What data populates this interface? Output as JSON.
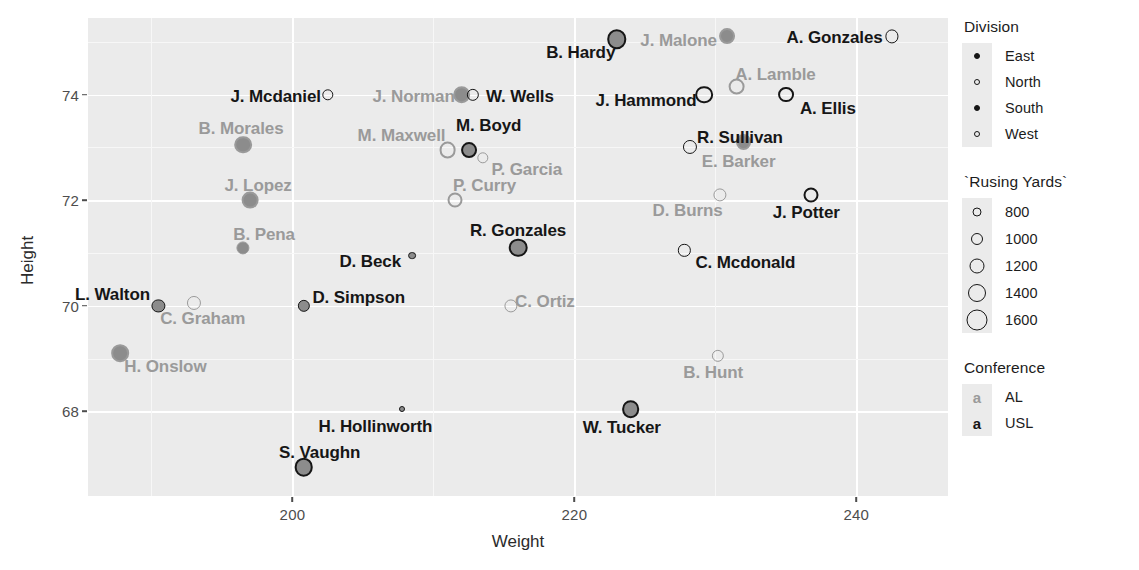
{
  "chart_data": {
    "type": "scatter",
    "title": "",
    "xlabel": "Weight",
    "ylabel": "Height",
    "xlim": [
      185.5,
      246.5
    ],
    "ylim": [
      66.4,
      75.45
    ],
    "xticks": [
      200,
      220,
      240
    ],
    "yticks": [
      68,
      70,
      72,
      74
    ],
    "grid": true,
    "legend_position": "right",
    "size_field": "`Rusing Yards`",
    "color_field": "Conference",
    "shape_field": "Division",
    "points": [
      {
        "label": "B. Hardy",
        "x": 223.0,
        "y": 75.05,
        "yards": 1350,
        "conference": "USL",
        "division": "South",
        "label_dx": -36,
        "label_dy": 14
      },
      {
        "label": "J. Malone",
        "x": 230.8,
        "y": 75.1,
        "yards": 1150,
        "conference": "AL",
        "division": "South",
        "label_dx": -48,
        "label_dy": 5
      },
      {
        "label": "A. Gonzales",
        "x": 242.5,
        "y": 75.1,
        "yards": 1000,
        "conference": "USL",
        "division": "West",
        "label_dx": -57,
        "label_dy": 2
      },
      {
        "label": "J. Mcdaniel",
        "x": 202.5,
        "y": 74.0,
        "yards": 900,
        "conference": "USL",
        "division": "North",
        "label_dx": -52,
        "label_dy": 2
      },
      {
        "label": "J. Norman",
        "x": 212.0,
        "y": 74.0,
        "yards": 1250,
        "conference": "AL",
        "division": "South",
        "label_dx": -48,
        "label_dy": 2
      },
      {
        "label": "W. Wells",
        "x": 212.8,
        "y": 74.0,
        "yards": 950,
        "conference": "USL",
        "division": "West",
        "label_dx": 47,
        "label_dy": 2
      },
      {
        "label": "J. Hammond",
        "x": 229.2,
        "y": 74.0,
        "yards": 1250,
        "conference": "USL",
        "division": "West",
        "label_dx": -58,
        "label_dy": 6
      },
      {
        "label": "A. Lamble",
        "x": 231.5,
        "y": 74.15,
        "yards": 1200,
        "conference": "AL",
        "division": "West",
        "label_dx": 39,
        "label_dy": -12
      },
      {
        "label": "A. Ellis",
        "x": 235.0,
        "y": 74.0,
        "yards": 1150,
        "conference": "USL",
        "division": "West",
        "label_dx": 42,
        "label_dy": 14
      },
      {
        "label": "B. Morales",
        "x": 196.5,
        "y": 73.05,
        "yards": 1250,
        "conference": "AL",
        "division": "South",
        "label_dx": -2,
        "label_dy": -16
      },
      {
        "label": "M. Maxwell",
        "x": 211.0,
        "y": 72.95,
        "yards": 1200,
        "conference": "AL",
        "division": "West",
        "label_dx": -46,
        "label_dy": -14
      },
      {
        "label": "M. Boyd",
        "x": 212.5,
        "y": 72.95,
        "yards": 1150,
        "conference": "USL",
        "division": "South",
        "label_dx": 20,
        "label_dy": -24
      },
      {
        "label": "P. Garcia",
        "x": 213.5,
        "y": 72.8,
        "yards": 900,
        "conference": "AL",
        "division": "West",
        "label_dx": 44,
        "label_dy": 12
      },
      {
        "label": "R. Sullivan",
        "x": 228.2,
        "y": 73.0,
        "yards": 1050,
        "conference": "USL",
        "division": "West",
        "label_dx": 50,
        "label_dy": -9
      },
      {
        "label": "E. Barker",
        "x": 232.0,
        "y": 73.1,
        "yards": 1150,
        "conference": "AL",
        "division": "South",
        "label_dx": -5,
        "label_dy": 20
      },
      {
        "label": "J. Lopez",
        "x": 197.0,
        "y": 72.0,
        "yards": 1200,
        "conference": "AL",
        "division": "South",
        "label_dx": 8,
        "label_dy": -14
      },
      {
        "label": "P. Curry",
        "x": 211.5,
        "y": 72.0,
        "yards": 1100,
        "conference": "AL",
        "division": "West",
        "label_dx": 30,
        "label_dy": -14
      },
      {
        "label": "D. Burns",
        "x": 230.3,
        "y": 72.1,
        "yards": 1000,
        "conference": "AL",
        "division": "West",
        "label_dx": -32,
        "label_dy": 16
      },
      {
        "label": "J. Potter",
        "x": 236.8,
        "y": 72.1,
        "yards": 1100,
        "conference": "USL",
        "division": "West",
        "label_dx": -5,
        "label_dy": 18
      },
      {
        "label": "B. Pena",
        "x": 196.5,
        "y": 71.1,
        "yards": 1000,
        "conference": "AL",
        "division": "South",
        "label_dx": 21,
        "label_dy": -13
      },
      {
        "label": "R. Gonzales",
        "x": 216.0,
        "y": 71.1,
        "yards": 1300,
        "conference": "USL",
        "division": "South",
        "label_dx": 0,
        "label_dy": -17
      },
      {
        "label": "D. Beck",
        "x": 208.5,
        "y": 70.95,
        "yards": 700,
        "conference": "USL",
        "division": "South",
        "label_dx": -42,
        "label_dy": 6
      },
      {
        "label": "C. Mcdonald",
        "x": 227.8,
        "y": 71.05,
        "yards": 950,
        "conference": "USL",
        "division": "West",
        "label_dx": 61,
        "label_dy": 13
      },
      {
        "label": "L. Walton",
        "x": 190.5,
        "y": 70.0,
        "yards": 1000,
        "conference": "USL",
        "division": "South",
        "label_dx": -46,
        "label_dy": -11
      },
      {
        "label": "C. Graham",
        "x": 193.0,
        "y": 70.05,
        "yards": 1050,
        "conference": "AL",
        "division": "West",
        "label_dx": 9,
        "label_dy": 16
      },
      {
        "label": "D. Simpson",
        "x": 200.8,
        "y": 70.0,
        "yards": 950,
        "conference": "USL",
        "division": "South",
        "label_dx": 55,
        "label_dy": -8
      },
      {
        "label": "C. Ortiz",
        "x": 215.5,
        "y": 70.0,
        "yards": 1000,
        "conference": "AL",
        "division": "West",
        "label_dx": 34,
        "label_dy": -4
      },
      {
        "label": "H. Onslow",
        "x": 187.8,
        "y": 69.1,
        "yards": 1250,
        "conference": "AL",
        "division": "South",
        "label_dx": 45,
        "label_dy": 14
      },
      {
        "label": "B. Hunt",
        "x": 230.2,
        "y": 69.05,
        "yards": 950,
        "conference": "AL",
        "division": "West",
        "label_dx": -5,
        "label_dy": 17
      },
      {
        "label": "H. Hollinworth",
        "x": 207.8,
        "y": 68.05,
        "yards": 600,
        "conference": "USL",
        "division": "South",
        "label_dx": -27,
        "label_dy": 18
      },
      {
        "label": "W. Tucker",
        "x": 224.0,
        "y": 68.05,
        "yards": 1250,
        "conference": "USL",
        "division": "South",
        "label_dx": -9,
        "label_dy": 19
      },
      {
        "label": "S. Vaughn",
        "x": 200.8,
        "y": 66.95,
        "yards": 1300,
        "conference": "USL",
        "division": "South",
        "label_dx": 16,
        "label_dy": -14
      }
    ]
  },
  "axes": {
    "ylabel": "Height",
    "xlabel": "Weight",
    "yticks": [
      "74",
      "72",
      "70",
      "68"
    ],
    "xticks": [
      "200",
      "220",
      "240"
    ]
  },
  "legends": {
    "division": {
      "title": "Division",
      "items": [
        {
          "label": "East",
          "shape": "filled-small-circle"
        },
        {
          "label": "North",
          "shape": "open-small-circle"
        },
        {
          "label": "South",
          "shape": "filled-small-circle"
        },
        {
          "label": "West",
          "shape": "open-small-circle"
        }
      ]
    },
    "size": {
      "title": "`Rusing Yards`",
      "items": [
        {
          "label": "800",
          "d": 9
        },
        {
          "label": "1000",
          "d": 12
        },
        {
          "label": "1200",
          "d": 15
        },
        {
          "label": "1400",
          "d": 18
        },
        {
          "label": "1600",
          "d": 21
        }
      ]
    },
    "conference": {
      "title": "Conference",
      "items": [
        {
          "label": "AL",
          "glyph": "a",
          "color": "#9a9a9a"
        },
        {
          "label": "USL",
          "glyph": "a",
          "color": "#161616"
        }
      ]
    }
  },
  "colors": {
    "panel": "#ebebeb",
    "grid_major": "#ffffff",
    "al": "#9a9a9a",
    "usl": "#161616",
    "axis_text": "#4d4d4d"
  }
}
